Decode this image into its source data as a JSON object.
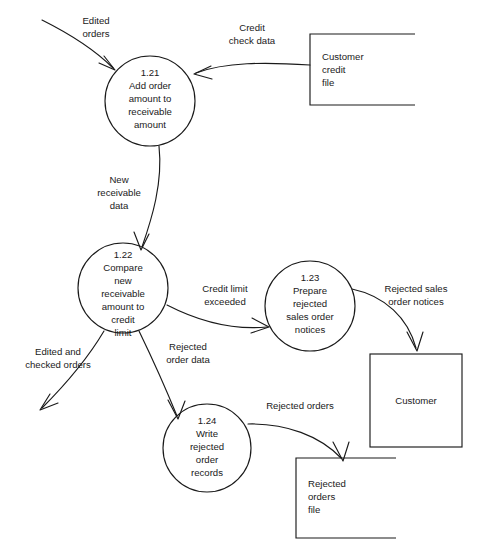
{
  "diagram": {
    "type": "data-flow-diagram",
    "background_color": "#ffffff",
    "stroke_color": "#1a1a1a"
  },
  "processes": [
    {
      "id": "1.21",
      "number": "1.21",
      "lines": [
        "1.21",
        "Add order",
        "amount to",
        "receivable",
        "amount"
      ],
      "cx": 150,
      "cy": 101,
      "r": 45
    },
    {
      "id": "1.22",
      "number": "1.22",
      "lines": [
        "1.22",
        "Compare",
        "new",
        "receivable",
        "amount to",
        "credit",
        "limit"
      ],
      "cx": 123,
      "cy": 288,
      "r": 45
    },
    {
      "id": "1.23",
      "number": "1.23",
      "lines": [
        "1.23",
        "Prepare",
        "rejected",
        "sales order",
        "notices"
      ],
      "cx": 310,
      "cy": 306,
      "r": 45
    },
    {
      "id": "1.24",
      "number": "1.24",
      "lines": [
        "1.24",
        "Write",
        "rejected",
        "order",
        "records"
      ],
      "cx": 207,
      "cy": 448,
      "r": 44
    }
  ],
  "data_stores": [
    {
      "id": "customer-credit-file",
      "lines": [
        "Customer",
        "credit",
        "file"
      ],
      "x": 310,
      "y": 34,
      "width": 105,
      "height": 71
    },
    {
      "id": "rejected-orders-file",
      "lines": [
        "Rejected",
        "orders",
        "file"
      ],
      "x": 296,
      "y": 458,
      "width": 100,
      "height": 80
    }
  ],
  "external_entities": [
    {
      "id": "customer",
      "label": "Customer",
      "x": 370,
      "y": 354,
      "width": 92,
      "height": 93
    }
  ],
  "flows": [
    {
      "id": "edited-orders",
      "lines": [
        "Edited",
        "orders"
      ],
      "label_x": 96,
      "label_y": 20
    },
    {
      "id": "credit-check-data",
      "lines": [
        "Credit",
        "check data"
      ],
      "label_x": 252,
      "label_y": 27
    },
    {
      "id": "new-receivable-data",
      "lines": [
        "New",
        "receivable",
        "data"
      ],
      "label_x": 119,
      "label_y": 183
    },
    {
      "id": "credit-limit-exceeded",
      "lines": [
        "Credit limit",
        "exceeded"
      ],
      "label_x": 225,
      "label_y": 289
    },
    {
      "id": "rejected-sales-order-notices",
      "lines": [
        "Rejected sales",
        "order notices"
      ],
      "label_x": 416,
      "label_y": 290
    },
    {
      "id": "edited-and-checked-orders",
      "lines": [
        "Edited and",
        "checked orders"
      ],
      "label_x": 58,
      "label_y": 355
    },
    {
      "id": "rejected-order-data",
      "lines": [
        "Rejected",
        "order data"
      ],
      "label_x": 188,
      "label_y": 350
    },
    {
      "id": "rejected-orders",
      "lines": [
        "Rejected orders"
      ],
      "label_x": 300,
      "label_y": 406
    }
  ]
}
